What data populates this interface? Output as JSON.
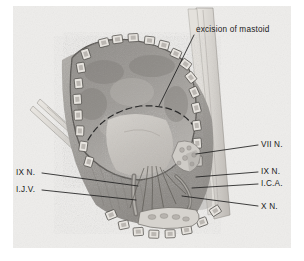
{
  "figure": {
    "kind": "surgical-anatomy-illustration",
    "title_label": "excision of mastoid",
    "palette": {
      "paper": "#ffffff",
      "plate_background": "#eeedeb",
      "ink": "#1a1a1a",
      "tissue_dark": "#8c8a86",
      "tissue_mid": "#a6a3a0",
      "tissue_light": "#c9c6c2",
      "bone_highlight": "#dedbd6",
      "clip_fill": "#e6e3de",
      "leader_line": "#2a2a2a"
    },
    "annotations": [
      {
        "id": "excision-of-mastoid",
        "text": "excision of mastoid",
        "side": "top-right",
        "label_x": 196,
        "label_y": 31,
        "target_x": 159,
        "target_y": 106
      },
      {
        "id": "vii-n",
        "text": "VII N.",
        "side": "right",
        "label_x": 261,
        "label_y": 147,
        "target_x": 196,
        "target_y": 154
      },
      {
        "id": "ix-n-right",
        "text": "IX N.",
        "side": "right",
        "label_x": 261,
        "label_y": 174,
        "target_x": 196,
        "target_y": 177
      },
      {
        "id": "i-c-a",
        "text": "I.C.A.",
        "side": "right",
        "label_x": 261,
        "label_y": 186,
        "target_x": 192,
        "target_y": 188
      },
      {
        "id": "x-n",
        "text": "X N.",
        "side": "right",
        "label_x": 261,
        "label_y": 209,
        "target_x": 182,
        "target_y": 196
      },
      {
        "id": "ix-n-left",
        "text": "IX N.",
        "side": "left",
        "label_x": 18,
        "label_y": 174,
        "target_x": 138,
        "target_y": 186
      },
      {
        "id": "i-j-v",
        "text": "I.J.V.",
        "side": "left",
        "label_x": 18,
        "label_y": 191,
        "target_x": 136,
        "target_y": 200
      }
    ],
    "features": {
      "dashed_excision_arc": "dashed curve across retracted mass",
      "wound_margin_clips": "chain of scalp clips around wound edge",
      "retractor_left": "two thin retractor shafts entering upper-left",
      "retractor_right": "long retractor blade along right margin",
      "retracted_mass": "cerebellum / soft tissue flap",
      "neurovascular_bundle": "nerve and vessel fibers in lower field"
    }
  }
}
